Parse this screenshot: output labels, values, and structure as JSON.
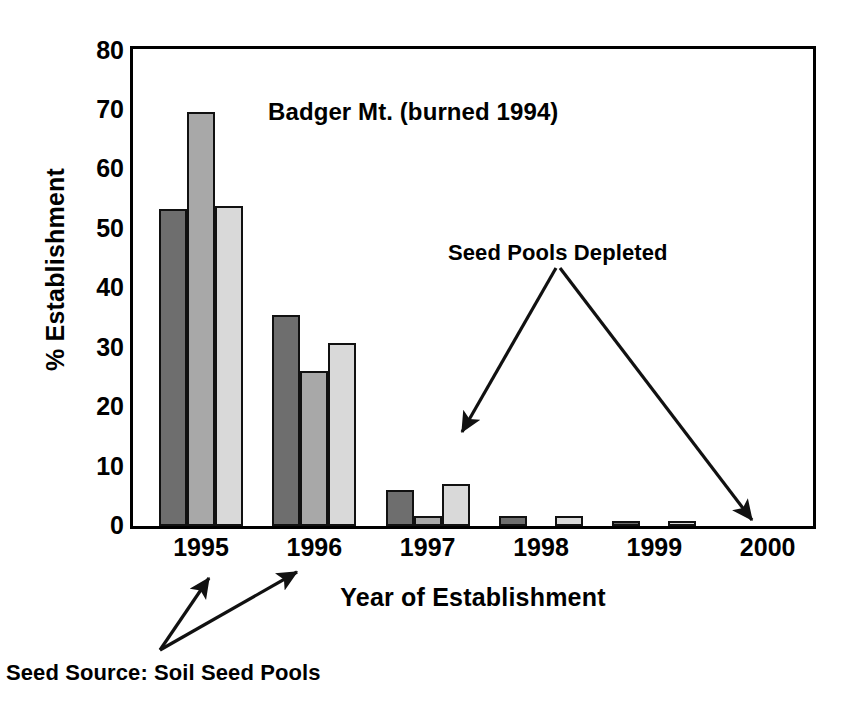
{
  "chart_data": {
    "type": "bar",
    "title": "Badger Mt. (burned 1994)",
    "xlabel": "Year of Establishment",
    "ylabel": "% Establishment",
    "categories": [
      "1995",
      "1996",
      "1997",
      "1998",
      "1999",
      "2000"
    ],
    "ylim": [
      0,
      80
    ],
    "yticks": [
      80,
      70,
      60,
      50,
      40,
      30,
      20,
      10,
      0
    ],
    "grid": false,
    "legend": "none",
    "series": [
      {
        "name": "series-1",
        "color": "#6e6e6e",
        "values": [
          53.2,
          35.4,
          6.0,
          1.7,
          0.9,
          0
        ]
      },
      {
        "name": "series-2",
        "color": "#a8a8a8",
        "values": [
          69.5,
          26.0,
          1.7,
          0,
          0,
          0
        ]
      },
      {
        "name": "series-3",
        "color": "#d9d9d9",
        "values": [
          53.7,
          30.7,
          7.0,
          1.7,
          0.8,
          0
        ]
      }
    ],
    "annotations": [
      {
        "name": "seed-pools-depleted",
        "text": "Seed Pools Depleted"
      },
      {
        "name": "seed-source",
        "text": "Seed Source: Soil Seed Pools"
      }
    ]
  },
  "figure": {
    "background": "#ffffff",
    "axis_color": "#000000"
  }
}
